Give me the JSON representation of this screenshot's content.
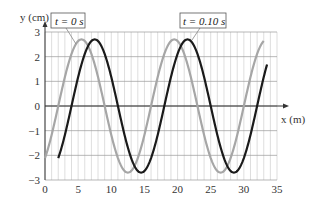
{
  "chart_data": {
    "type": "line",
    "title": "",
    "xlabel": "x (m)",
    "ylabel": "y (cm)",
    "xlim": [
      0,
      35
    ],
    "ylim": [
      -3,
      3
    ],
    "x_ticks": [
      0,
      5,
      10,
      15,
      20,
      25,
      30,
      35
    ],
    "y_ticks": [
      -3,
      -2,
      -1,
      0,
      1,
      2,
      3
    ],
    "grid": true,
    "grid_x_step": 1,
    "grid_y_step": 1,
    "legend": "none (callout labels)",
    "series": [
      {
        "name": "t = 0 s",
        "label": "t = 0 s",
        "color": "#a6a6a6",
        "amplitude": 2.7,
        "wavelength": 14,
        "x_range": [
          0,
          33
        ],
        "points": [
          [
            0,
            -2.1
          ],
          [
            2,
            0
          ],
          [
            5.5,
            2.7
          ],
          [
            9,
            0
          ],
          [
            12.5,
            -2.7
          ],
          [
            16,
            0
          ],
          [
            19.5,
            2.7
          ],
          [
            23,
            0
          ],
          [
            26.5,
            -2.7
          ],
          [
            30,
            0
          ],
          [
            33,
            2.6
          ]
        ]
      },
      {
        "name": "t = 0.10 s",
        "label": "t = 0.10 s",
        "color": "#1a1a1a",
        "amplitude": 2.7,
        "wavelength": 14,
        "x_range": [
          2,
          33.5
        ],
        "points": [
          [
            2,
            -2.1
          ],
          [
            4,
            0
          ],
          [
            7.5,
            2.7
          ],
          [
            11,
            0
          ],
          [
            14.5,
            -2.7
          ],
          [
            18,
            0
          ],
          [
            21.5,
            2.7
          ],
          [
            25,
            0
          ],
          [
            28.5,
            -2.7
          ],
          [
            32,
            0
          ],
          [
            33.5,
            1.8
          ]
        ]
      }
    ],
    "annotations": [
      {
        "text": "t = 0 s",
        "points_to": "t = 0 s"
      },
      {
        "text": "t = 0.10 s",
        "points_to": "t = 0.10 s"
      }
    ]
  },
  "axes": {
    "x_label": "x (m)",
    "y_label": "y (cm)",
    "x_tick_labels": [
      "0",
      "5",
      "10",
      "15",
      "20",
      "25",
      "30",
      "35"
    ],
    "y_tick_labels": [
      "3",
      "2",
      "1",
      "0",
      "−1",
      "−2",
      "−3"
    ]
  },
  "labels": {
    "t0": "t = 0 s",
    "t1": "t = 0.10 s"
  }
}
